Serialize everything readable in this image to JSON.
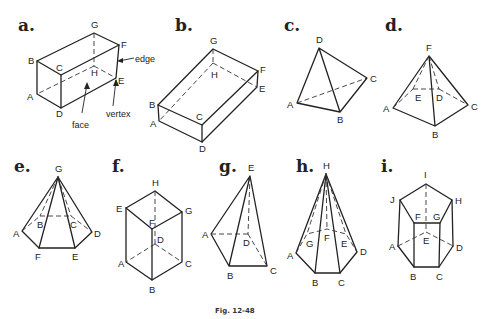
{
  "caption": "Fig. 12-48",
  "figures": [
    {
      "id": "a",
      "letter": "a.",
      "name": "rectangular prism",
      "vertices": [
        "A",
        "B",
        "C",
        "D",
        "E",
        "F",
        "G",
        "H"
      ],
      "annotations": {
        "edge": "edge",
        "face": "face",
        "vertex": "vertex"
      }
    },
    {
      "id": "b",
      "letter": "b.",
      "name": "rectangular prism",
      "vertices": [
        "A",
        "B",
        "C",
        "D",
        "E",
        "F",
        "G",
        "H"
      ]
    },
    {
      "id": "c",
      "letter": "c.",
      "name": "tetrahedron",
      "vertices": [
        "A",
        "B",
        "C",
        "D"
      ]
    },
    {
      "id": "d",
      "letter": "d.",
      "name": "square pyramid",
      "vertices": [
        "A",
        "B",
        "C",
        "D",
        "E",
        "F"
      ]
    },
    {
      "id": "e",
      "letter": "e.",
      "name": "hexagonal pyramid",
      "vertices": [
        "A",
        "B",
        "C",
        "D",
        "E",
        "F",
        "G"
      ]
    },
    {
      "id": "f",
      "letter": "f.",
      "name": "rectangular prism",
      "vertices": [
        "A",
        "B",
        "C",
        "D",
        "E",
        "F",
        "G",
        "H"
      ]
    },
    {
      "id": "g",
      "letter": "g.",
      "name": "square pyramid",
      "vertices": [
        "A",
        "B",
        "C",
        "D",
        "E"
      ]
    },
    {
      "id": "h",
      "letter": "h.",
      "name": "heptagonal pyramid",
      "vertices": [
        "A",
        "B",
        "C",
        "D",
        "E",
        "F",
        "G",
        "H"
      ]
    },
    {
      "id": "i",
      "letter": "i.",
      "name": "pentagonal prism",
      "vertices": [
        "A",
        "B",
        "C",
        "D",
        "E",
        "F",
        "G",
        "H",
        "I",
        "J"
      ]
    }
  ]
}
